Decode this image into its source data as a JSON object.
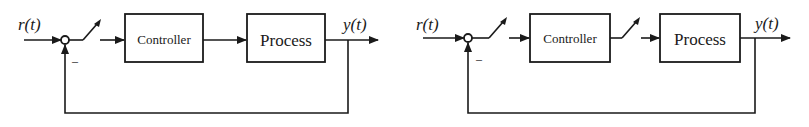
{
  "diagrams": [
    {
      "name": "left",
      "input_label": "r(t)",
      "output_label": "y(t)",
      "feedback_sign": "–",
      "blocks": [
        {
          "label": "Controller"
        },
        {
          "label": "Process"
        }
      ],
      "switches": [
        "error-sampler"
      ]
    },
    {
      "name": "right",
      "input_label": "r(t)",
      "output_label": "y(t)",
      "feedback_sign": "–",
      "blocks": [
        {
          "label": "Controller"
        },
        {
          "label": "Process"
        }
      ],
      "switches": [
        "error-sampler",
        "control-sampler"
      ]
    }
  ],
  "colors": {
    "line": "#1a1a1a",
    "background": "#ffffff"
  }
}
